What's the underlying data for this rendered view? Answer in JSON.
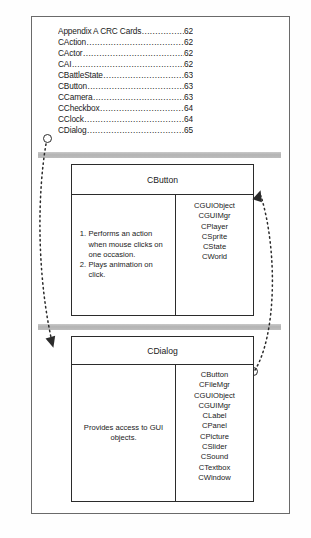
{
  "document": {
    "kind": "crc-card-diagram-page"
  },
  "toc": {
    "dot_leader": "................................................",
    "entries": [
      {
        "label": "Appendix A CRC Cards",
        "page": "62"
      },
      {
        "label": "CAction",
        "page": "62"
      },
      {
        "label": "CActor",
        "page": "62"
      },
      {
        "label": "CAI",
        "page": "62"
      },
      {
        "label": "CBattleState",
        "page": "63"
      },
      {
        "label": "CButton",
        "page": "63"
      },
      {
        "label": "CCamera",
        "page": "63"
      },
      {
        "label": "CCheckbox",
        "page": "64"
      },
      {
        "label": "CClock",
        "page": "64"
      },
      {
        "label": "CDialog",
        "page": "65"
      }
    ]
  },
  "highlights": {
    "bar_color": "#bdbdbd",
    "bar_1_target": "CDialog",
    "bar_2_target": "CDialog"
  },
  "cards": [
    {
      "title": "CButton",
      "responsibilities": [
        {
          "num": "1.",
          "text": "Performs an action when mouse clicks on one occasion."
        },
        {
          "num": "2.",
          "text": "Plays animation on click."
        }
      ],
      "responsibility_paragraph": "",
      "collaborators": [
        "CGUIObject",
        "CGUIMgr",
        "CPlayer",
        "CSprite",
        "CState",
        "CWorld"
      ]
    },
    {
      "title": "CDialog",
      "responsibilities": [],
      "responsibility_paragraph": "Provides access to GUI objects.",
      "collaborators": [
        "CButton",
        "CFileMgr",
        "CGUIObject",
        "CGUIMgr",
        "CLabel",
        "CPanel",
        "CPicture",
        "CSlider",
        "CSound",
        "CTextbox",
        "CWindow"
      ]
    }
  ],
  "connectors": {
    "toc_anchor_label": "CDialog",
    "left_arrow_from": "toc-cdialog-entry",
    "left_arrow_to": "cdialog-card",
    "right_arrow_from": "cdialog-collaborator-cbutton",
    "right_arrow_to": "cbutton-card",
    "line_color": "#2b2b2b",
    "style": "dotted"
  }
}
